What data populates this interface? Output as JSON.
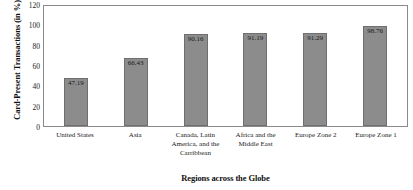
{
  "chart_data": {
    "type": "bar",
    "title": "",
    "xlabel": "Regions across the Globe",
    "ylabel": "Card-Present Transactions (in %)",
    "categories": [
      "United States",
      "Asia",
      "Canada, Latin America, and the Carribbean",
      "Africa and the Middle East",
      "Europe Zone 2",
      "Europe Zone 1"
    ],
    "category_lines": [
      [
        "United States"
      ],
      [
        "Asia"
      ],
      [
        "Canada, Latin",
        "America, and the",
        "Carribbean"
      ],
      [
        "Africa and the",
        "Middle East"
      ],
      [
        "Europe Zone 2"
      ],
      [
        "Europe Zone 1"
      ]
    ],
    "values": [
      47.19,
      66.43,
      90.16,
      91.19,
      91.29,
      98.76
    ],
    "value_labels": [
      "47.19",
      "66.43",
      "90.16",
      "91.19",
      "91.29",
      "98.76"
    ],
    "ylim": [
      0,
      120
    ],
    "yticks": [
      0,
      20,
      40,
      60,
      80,
      100,
      120
    ],
    "ytick_labels": [
      "0",
      "20",
      "40",
      "60",
      "80",
      "100",
      "120"
    ],
    "grid": false,
    "legend": false,
    "legend_position": "none",
    "bar_color": "#8c8c8c",
    "bar_edge_color": "#6f6f6f",
    "plot_border_color": "#8a8a8a",
    "background_color": "#ffffff",
    "text_color": "#1a1a1a"
  }
}
